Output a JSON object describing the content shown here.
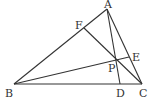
{
  "diagram": {
    "type": "triangle-cevians",
    "points": {
      "A": {
        "label": "A",
        "x": 107,
        "y": 9,
        "lx": 104,
        "ly": 8
      },
      "B": {
        "label": "B",
        "x": 14,
        "y": 84,
        "lx": 5,
        "ly": 97
      },
      "C": {
        "label": "C",
        "x": 142,
        "y": 84,
        "lx": 139,
        "ly": 97
      },
      "D": {
        "label": "D",
        "x": 120,
        "y": 84,
        "lx": 116,
        "ly": 97
      },
      "E": {
        "label": "E",
        "x": 129,
        "y": 57,
        "lx": 132,
        "ly": 61
      },
      "F": {
        "label": "F",
        "x": 84,
        "y": 28,
        "lx": 75,
        "ly": 29
      },
      "P": {
        "label": "P",
        "x": 116,
        "y": 60,
        "lx": 108,
        "ly": 72
      }
    },
    "segments": [
      [
        "A",
        "B"
      ],
      [
        "B",
        "C"
      ],
      [
        "C",
        "A"
      ],
      [
        "A",
        "D"
      ],
      [
        "B",
        "E"
      ],
      [
        "C",
        "F"
      ]
    ],
    "stroke_color": "#333333"
  }
}
